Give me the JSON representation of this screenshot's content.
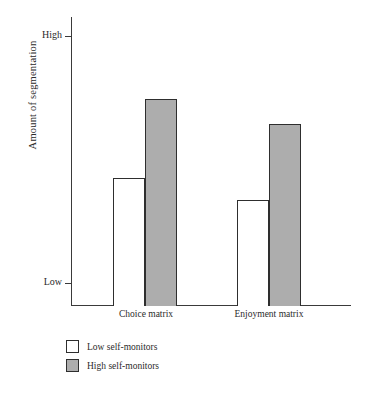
{
  "chart_data": {
    "type": "bar",
    "title": "",
    "subtitle": "",
    "xlabel": "",
    "ylabel": "Amount of segmentation",
    "categories": [
      "Choice matrix",
      "Enjoyment matrix"
    ],
    "series": [
      {
        "name": "Low self-monitors",
        "values": [
          0.425,
          0.336
        ],
        "color": "#ffffff"
      },
      {
        "name": "High self-monitors",
        "values": [
          0.745,
          0.644
        ],
        "color": "#adadad"
      }
    ],
    "ytick_labels": [
      "Low",
      "High"
    ],
    "ytick_values": [
      0,
      1
    ],
    "ylim": [
      0,
      1
    ],
    "grid": false,
    "legend_position": "below-left"
  },
  "axis": {
    "y_title": "Amount of segmentation",
    "y_high_label": "High",
    "y_low_label": "Low"
  },
  "categories": {
    "c0": "Choice matrix",
    "c1": "Enjoyment matrix"
  },
  "legend": {
    "items": [
      {
        "label": "Low self-monitors",
        "swatch": "white-square-swatch"
      },
      {
        "label": "High self-monitors",
        "swatch": "gray-square-swatch"
      }
    ]
  },
  "colors": {
    "bar_low": "#ffffff",
    "bar_high": "#adadad",
    "outline": "#2e2e2e",
    "axis": "#3a3a3a",
    "text": "#2b2b2b",
    "background": "#ffffff"
  }
}
